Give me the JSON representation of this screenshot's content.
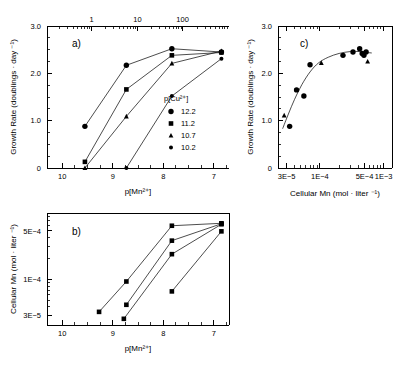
{
  "figure": {
    "panels": [
      "a",
      "b",
      "c"
    ],
    "panel_a_label": "a)",
    "panel_b_label": "b)",
    "panel_c_label": "c)"
  },
  "panel_a": {
    "letter": "a)",
    "ylabel": "Growth Rate  (doublings · day ⁻¹)",
    "xlabel": "p[Mn²⁺]",
    "y_ticks": [
      "0",
      "1.0",
      "2.0",
      "3.0"
    ],
    "y_values": [
      0,
      1.0,
      2.0,
      3.0
    ],
    "ylim": [
      0,
      3.0
    ],
    "x_ticks": [
      "10",
      "9",
      "8",
      "7"
    ],
    "x_values": [
      10,
      9,
      8,
      7
    ],
    "xlim": [
      10.3,
      6.7
    ],
    "top_axis_ticks": [
      "1",
      "10",
      "100"
    ],
    "top_axis_values": [
      1,
      10,
      100
    ],
    "legend_title": "p[Cu²⁺]",
    "legend_items": [
      {
        "label": "12.2",
        "marker": "circle"
      },
      {
        "label": "11.2",
        "marker": "square"
      },
      {
        "label": "10.7",
        "marker": "triangle"
      },
      {
        "label": "10.2",
        "marker": "circle-small"
      }
    ]
  },
  "panel_b": {
    "letter": "b)",
    "ylabel": "Cellular Mn  (mol · liter ⁻¹)",
    "xlabel": "p[Mn²⁺]",
    "y_ticks": [
      "3E−5",
      "1E−4",
      "5E−4"
    ],
    "y_values": [
      3e-05,
      0.0001,
      0.0005
    ],
    "ylim": [
      2.2e-05,
      0.0009
    ],
    "x_ticks": [
      "10",
      "9",
      "8",
      "7"
    ],
    "x_values": [
      10,
      9,
      8,
      7
    ],
    "xlim": [
      10.3,
      6.7
    ]
  },
  "panel_c": {
    "letter": "c)",
    "ylabel": "Growth Rate  (doublings · day ⁻¹)",
    "xlabel": "Cellular Mn  (mol · liter ⁻¹)",
    "y_ticks": [
      "0",
      "1.0",
      "2.0",
      "3.0"
    ],
    "y_values": [
      0,
      1.0,
      2.0,
      3.0
    ],
    "ylim": [
      0,
      3.0
    ],
    "x_ticks": [
      "3E−5",
      "1E−4",
      "5E−4",
      "1E−3"
    ],
    "x_values": [
      3e-05,
      0.0001,
      0.0005,
      0.001
    ],
    "xlim": [
      2.2e-05,
      0.00135
    ]
  },
  "chart_data": [
    {
      "id": "panel_a",
      "type": "line",
      "title": "a)",
      "xlabel": "p[Mn2+]",
      "ylabel": "Growth Rate (doublings·day-1)",
      "xlim": [
        10.3,
        6.7
      ],
      "ylim": [
        0,
        3.0
      ],
      "x_reversed": true,
      "grid": false,
      "legend_title": "p[Cu2+]",
      "legend_position": "inside-right",
      "series": [
        {
          "name": "12.2",
          "marker": "circle",
          "points": [
            {
              "x": 9.55,
              "y": 0.88
            },
            {
              "x": 8.73,
              "y": 2.17
            },
            {
              "x": 7.83,
              "y": 2.52
            },
            {
              "x": 6.85,
              "y": 2.45
            }
          ]
        },
        {
          "name": "11.2",
          "marker": "square",
          "points": [
            {
              "x": 9.55,
              "y": 0.13
            },
            {
              "x": 8.73,
              "y": 1.66
            },
            {
              "x": 7.83,
              "y": 2.38
            },
            {
              "x": 6.85,
              "y": 2.44
            }
          ]
        },
        {
          "name": "10.7",
          "marker": "triangle",
          "points": [
            {
              "x": 9.55,
              "y": 0.0
            },
            {
              "x": 8.73,
              "y": 1.09
            },
            {
              "x": 7.83,
              "y": 2.21
            },
            {
              "x": 6.85,
              "y": 2.47
            }
          ]
        },
        {
          "name": "10.2",
          "marker": "circle-small",
          "points": [
            {
              "x": 8.73,
              "y": 0.0
            },
            {
              "x": 7.83,
              "y": 1.52
            },
            {
              "x": 6.85,
              "y": 2.31
            }
          ]
        }
      ]
    },
    {
      "id": "panel_b",
      "type": "line",
      "title": "b)",
      "xlabel": "p[Mn2+]",
      "ylabel": "Cellular Mn (mol·liter-1)",
      "xlim": [
        10.3,
        6.7
      ],
      "ylim": [
        2.2e-05,
        0.0009
      ],
      "y_log": true,
      "x_reversed": true,
      "grid": false,
      "series": [
        {
          "name": "12.2",
          "marker": "square",
          "points": [
            {
              "x": 9.27,
              "y": 3.4e-05
            },
            {
              "x": 8.73,
              "y": 9.3e-05
            },
            {
              "x": 7.83,
              "y": 0.00059
            },
            {
              "x": 6.85,
              "y": 0.00064
            }
          ]
        },
        {
          "name": "11.2",
          "marker": "square",
          "points": [
            {
              "x": 8.73,
              "y": 4.3e-05
            },
            {
              "x": 7.83,
              "y": 0.00036
            },
            {
              "x": 6.85,
              "y": 0.00063
            }
          ]
        },
        {
          "name": "10.7",
          "marker": "triangle",
          "points": [
            {
              "x": 8.78,
              "y": 2.7e-05
            },
            {
              "x": 7.83,
              "y": 0.00023
            },
            {
              "x": 6.85,
              "y": 0.00062
            }
          ]
        },
        {
          "name": "10.2",
          "marker": "circle",
          "points": [
            {
              "x": 7.83,
              "y": 6.7e-05
            },
            {
              "x": 6.85,
              "y": 0.00049
            }
          ]
        }
      ]
    },
    {
      "id": "panel_c",
      "type": "scatter",
      "title": "c)",
      "xlabel": "Cellular Mn (mol·liter-1)",
      "ylabel": "Growth Rate (doublings·day-1)",
      "xlim": [
        2.2e-05,
        0.00135
      ],
      "ylim": [
        0,
        3.0
      ],
      "x_log": true,
      "grid": false,
      "fit_curve": true,
      "points": [
        {
          "x": 2.75e-05,
          "y": 1.11,
          "marker": "triangle"
        },
        {
          "x": 3.35e-05,
          "y": 0.88,
          "marker": "circle"
        },
        {
          "x": 4.3e-05,
          "y": 1.65,
          "marker": "circle"
        },
        {
          "x": 5.6e-05,
          "y": 1.52,
          "marker": "circle"
        },
        {
          "x": 7e-05,
          "y": 2.18,
          "marker": "circle"
        },
        {
          "x": 0.000105,
          "y": 2.22,
          "marker": "triangle"
        },
        {
          "x": 0.00023,
          "y": 2.38,
          "marker": "circle"
        },
        {
          "x": 0.00033,
          "y": 2.45,
          "marker": "circle"
        },
        {
          "x": 0.00042,
          "y": 2.52,
          "marker": "circle"
        },
        {
          "x": 0.00046,
          "y": 2.42,
          "marker": "circle"
        },
        {
          "x": 0.00049,
          "y": 2.38,
          "marker": "circle"
        },
        {
          "x": 0.00053,
          "y": 2.45,
          "marker": "circle"
        },
        {
          "x": 0.00056,
          "y": 2.25,
          "marker": "triangle"
        }
      ],
      "fit_points": [
        {
          "x": 2.6e-05,
          "y": 0.83
        },
        {
          "x": 3.2e-05,
          "y": 1.14
        },
        {
          "x": 4e-05,
          "y": 1.45
        },
        {
          "x": 5.2e-05,
          "y": 1.76
        },
        {
          "x": 7e-05,
          "y": 2.03
        },
        {
          "x": 9.5e-05,
          "y": 2.22
        },
        {
          "x": 0.000135,
          "y": 2.34
        },
        {
          "x": 0.0002,
          "y": 2.42
        },
        {
          "x": 0.0003,
          "y": 2.46
        },
        {
          "x": 0.00042,
          "y": 2.46
        },
        {
          "x": 0.00055,
          "y": 2.44
        },
        {
          "x": 0.00065,
          "y": 2.43
        }
      ]
    }
  ]
}
